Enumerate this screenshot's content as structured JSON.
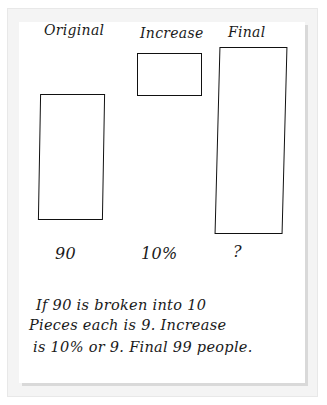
{
  "diagram": {
    "type": "tape-diagram",
    "columns": [
      {
        "header": "Original",
        "value": "90"
      },
      {
        "header": "Increase",
        "value": "10%"
      },
      {
        "header": "Final",
        "value": "?"
      }
    ],
    "explanation": [
      "If 90 is broken into 10",
      "Pieces each is 9. Increase",
      "is 10% or 9. Final 99 people."
    ]
  }
}
